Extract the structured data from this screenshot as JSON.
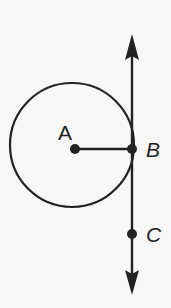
{
  "figure": {
    "points": {
      "A": {
        "label": "A",
        "x": 75,
        "y": 149
      },
      "B": {
        "label": "B",
        "x": 132,
        "y": 149
      },
      "C": {
        "label": "C",
        "x": 132,
        "y": 234
      }
    },
    "circle": {
      "center": "A",
      "cx": 72,
      "cy": 145,
      "r": 62
    },
    "line": {
      "x": 132,
      "y_top": 35,
      "y_bottom": 294,
      "arrows": "both"
    },
    "colors": {
      "stroke": "#222222",
      "background": "#f7f7f5"
    }
  }
}
